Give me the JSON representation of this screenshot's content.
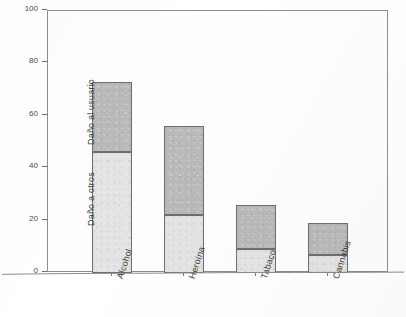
{
  "chart_data": {
    "type": "bar",
    "title": "",
    "subtitle": "",
    "xlabel": "",
    "ylabel": "DAÑO GENERAL",
    "ylim": [
      0,
      100
    ],
    "yticks": [
      0,
      20,
      40,
      60,
      80,
      100
    ],
    "ytick_labels": [
      "0",
      "20",
      "40",
      "60",
      "80",
      "100"
    ],
    "grid": false,
    "stacked": true,
    "legend_position": "in-plot-annotation",
    "categories": [
      "Alcohol",
      "Heroína",
      "Tabaco",
      "Cannabis"
    ],
    "series": [
      {
        "name": "Daño a otros",
        "color": "#e3e3e3",
        "values": [
          46,
          22,
          9,
          7
        ]
      },
      {
        "name": "Daño al usuario",
        "color": "#b9b9b9",
        "values": [
          27,
          34,
          17,
          12
        ]
      }
    ],
    "totals": [
      73,
      56,
      26,
      19
    ],
    "annotations": [
      {
        "text": "Daño al usuario",
        "target": "upper-segment"
      },
      {
        "text": "Daño a otros",
        "target": "lower-segment"
      }
    ]
  },
  "axis": {
    "y_title": "DAÑO GENERAL"
  }
}
